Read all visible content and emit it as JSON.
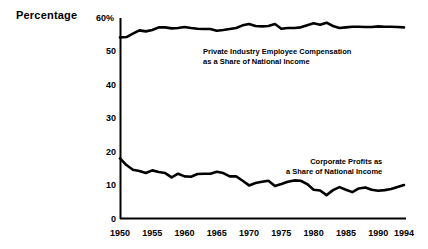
{
  "chart_data": {
    "type": "line",
    "title": "",
    "xlabel": "",
    "ylabel": "Percentage",
    "ylim": [
      0,
      60
    ],
    "xlim": [
      1950,
      1994
    ],
    "grid": false,
    "legend_position": "inline-annotation",
    "y_ticks": [
      "0",
      "10",
      "20",
      "30",
      "40",
      "50",
      "60%"
    ],
    "y_tick_values": [
      0,
      10,
      20,
      30,
      40,
      50,
      60
    ],
    "x_ticks": [
      "1950",
      "1955",
      "1960",
      "1965",
      "1970",
      "1975",
      "1980",
      "1985",
      "1990",
      "1994"
    ],
    "x_tick_values": [
      1950,
      1955,
      1960,
      1965,
      1970,
      1975,
      1980,
      1985,
      1990,
      1994
    ],
    "x": [
      1950,
      1951,
      1952,
      1953,
      1954,
      1955,
      1956,
      1957,
      1958,
      1959,
      1960,
      1961,
      1962,
      1963,
      1964,
      1965,
      1966,
      1967,
      1968,
      1969,
      1970,
      1971,
      1972,
      1973,
      1974,
      1975,
      1976,
      1977,
      1978,
      1979,
      1980,
      1981,
      1982,
      1983,
      1984,
      1985,
      1986,
      1987,
      1988,
      1989,
      1990,
      1991,
      1992,
      1993,
      1994
    ],
    "series": [
      {
        "name": "Private Industry Employee Compensation as a Share of National Income",
        "color": "#000000",
        "values": [
          54.2,
          54.3,
          55.3,
          56.3,
          56.0,
          56.4,
          57.2,
          57.2,
          56.9,
          57.0,
          57.3,
          57.0,
          56.8,
          56.7,
          56.7,
          56.2,
          56.4,
          56.7,
          57.0,
          57.8,
          58.2,
          57.6,
          57.5,
          57.6,
          58.2,
          56.8,
          57.0,
          57.0,
          57.2,
          57.8,
          58.4,
          58.0,
          58.6,
          57.6,
          57.0,
          57.2,
          57.4,
          57.4,
          57.3,
          57.3,
          57.5,
          57.4,
          57.4,
          57.3,
          57.2
        ]
      },
      {
        "name": "Corporate Profits as a Share of National Income",
        "color": "#000000",
        "values": [
          18.0,
          16.0,
          14.6,
          14.2,
          13.6,
          14.4,
          13.9,
          13.6,
          12.3,
          13.4,
          12.6,
          12.5,
          13.3,
          13.4,
          13.4,
          14.0,
          13.6,
          12.6,
          12.6,
          11.3,
          9.9,
          10.6,
          11.0,
          11.3,
          9.7,
          10.3,
          11.0,
          11.4,
          11.3,
          10.3,
          8.6,
          8.4,
          7.0,
          8.5,
          9.4,
          8.6,
          7.9,
          9.0,
          9.3,
          8.6,
          8.3,
          8.5,
          8.8,
          9.4,
          10.0
        ]
      }
    ],
    "annotations": [
      {
        "id": "compensation-label",
        "lines": [
          "Private Industry Employee Compensation",
          "as a Share of National Income"
        ]
      },
      {
        "id": "profits-label",
        "lines": [
          "Corporate Profits as",
          "a Share of National Income"
        ]
      }
    ]
  },
  "axis": {
    "y_title": "Percentage"
  }
}
